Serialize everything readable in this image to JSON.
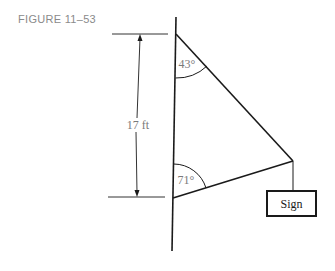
{
  "figure": {
    "label": "FIGURE 11–53"
  },
  "diagram": {
    "dimension_label": "17 ft",
    "top_angle": "43°",
    "bottom_angle": "71°",
    "sign_label": "Sign",
    "colors": {
      "line": "#1a1a1a",
      "label_gray": "#7a7a7a"
    }
  }
}
